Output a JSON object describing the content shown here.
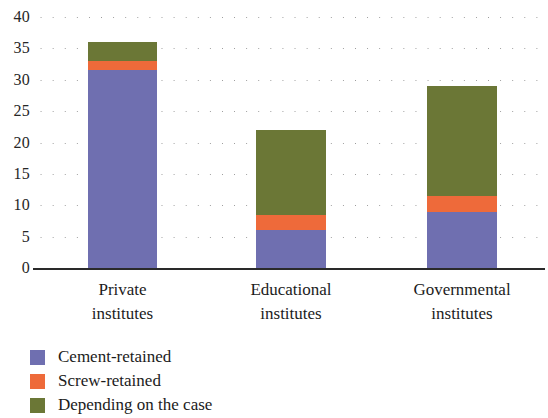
{
  "chart_data": {
    "type": "bar",
    "subtype": "stacked-bar",
    "title": "",
    "xlabel": "",
    "ylabel": "",
    "ylim": [
      0,
      40
    ],
    "ytick_step": 5,
    "yticks": [
      40,
      35,
      30,
      25,
      20,
      15,
      10,
      5,
      0
    ],
    "ytick_labels": [
      "40",
      "35",
      "30",
      "25",
      "20",
      "15",
      "10",
      "5",
      "0"
    ],
    "grid": true,
    "grid_style": "dotted",
    "grid_axis": "y",
    "legend_position": "below-left",
    "categories": [
      "Private institutes",
      "Educational institutes",
      "Governmental institutes"
    ],
    "category_lines": [
      [
        "Private",
        "institutes"
      ],
      [
        "Educational",
        "institutes"
      ],
      [
        "Governmental",
        "institutes"
      ]
    ],
    "series": [
      {
        "name": "Cement-retained",
        "color": "#6f6fb0",
        "values": [
          31.5,
          6,
          9
        ]
      },
      {
        "name": "Screw-retained",
        "color": "#ee6a3a",
        "values": [
          1.5,
          2.5,
          2.5
        ]
      },
      {
        "name": "Depending on the case",
        "color": "#6b7736",
        "values": [
          3,
          13.5,
          17.5
        ]
      }
    ],
    "totals": [
      36,
      22,
      29
    ]
  },
  "legend": {
    "items": [
      {
        "label": "Cement-retained",
        "color": "#6f6fb0"
      },
      {
        "label": "Screw-retained",
        "color": "#ee6a3a"
      },
      {
        "label": "Depending on the case",
        "color": "#6b7736"
      }
    ]
  },
  "axis": {
    "line_color": "#2a2a2a",
    "grid_color": "#9a9a9a",
    "tick_text_color": "#262626"
  }
}
